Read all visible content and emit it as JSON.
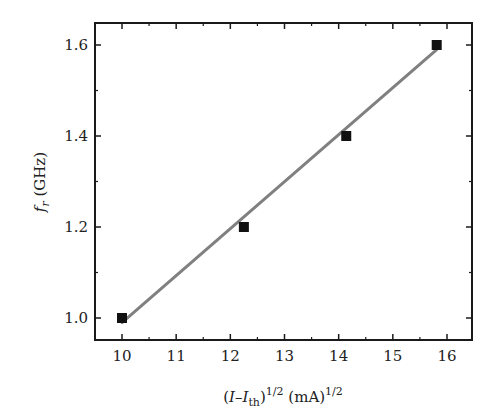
{
  "chart_data": {
    "type": "scatter",
    "title": "",
    "xlabel": "(I–I_th)^1/2 (mA)^1/2",
    "ylabel": "f_r (GHz)",
    "xlabel_parts": {
      "open": "(",
      "I": "I",
      "dash": "–",
      "Ith": "I",
      "sub": "th",
      "close": ")",
      "sup1": "1/2",
      "unit": " (mA)",
      "sup2": "1/2"
    },
    "ylabel_parts": {
      "f": "f",
      "sub": "r",
      "unit": " (GHz)"
    },
    "xlim": [
      9.6,
      16.45
    ],
    "ylim": [
      0.95,
      1.65
    ],
    "xticks": [
      10,
      11,
      12,
      13,
      14,
      15,
      16
    ],
    "xtick_labels": [
      "10",
      "11",
      "12",
      "13",
      "14",
      "15",
      "16"
    ],
    "yticks": [
      1.0,
      1.2,
      1.4,
      1.6
    ],
    "ytick_labels": [
      "1.0",
      "1.2",
      "1.4",
      "1.6"
    ],
    "grid": false,
    "legend": null,
    "series": [
      {
        "name": "measured",
        "marker": "square",
        "color": "#111111",
        "x": [
          10.0,
          12.25,
          14.14,
          15.81
        ],
        "y": [
          1.0,
          1.2,
          1.4,
          1.6
        ]
      },
      {
        "name": "linear fit",
        "type": "line",
        "color": "#808080",
        "x": [
          10.0,
          15.81
        ],
        "y": [
          0.99,
          1.59
        ]
      }
    ]
  }
}
